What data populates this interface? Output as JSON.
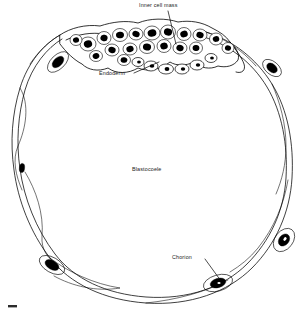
{
  "figure": {
    "kind": "biological-illustration",
    "background_color": "#ffffff",
    "ink_color": "#000000",
    "label_color": "#1a1a1a"
  },
  "labels": {
    "inner_cell_mass": "Inner cell mass",
    "endoderm": "Endoderm",
    "blastocoele": "Blastocoele",
    "chorion": "Chorion"
  },
  "structures": [
    {
      "name": "chorion",
      "description": "thin wavy double-layered outer wall enclosing the vesicle"
    },
    {
      "name": "blastocoele",
      "description": "large empty fluid-filled central cavity"
    },
    {
      "name": "inner_cell_mass",
      "description": "dense cluster of cells with dark nuclei at the top of the vesicle"
    },
    {
      "name": "endoderm",
      "description": "row of pale outlined cells lining the underside of the inner cell mass"
    },
    {
      "name": "trophoblast_nuclei",
      "description": "solid black elongated nuclei spaced around the chorionic wall"
    }
  ],
  "leader_lines": [
    {
      "for": "inner_cell_mass",
      "from": [
        168,
        11
      ],
      "to": [
        176,
        44
      ]
    },
    {
      "for": "endoderm",
      "from": [
        134,
        73
      ],
      "to": [
        159,
        62
      ]
    },
    {
      "for": "chorion",
      "from": [
        205,
        259
      ],
      "to": [
        221,
        281
      ]
    }
  ]
}
